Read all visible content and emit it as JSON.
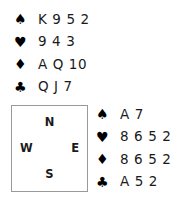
{
  "diagram": {
    "type": "bridge-hand-diagram",
    "suit_symbols": {
      "spade": "♠",
      "heart": "♥",
      "diamond": "♦",
      "club": "♣"
    },
    "suit_color": "#000000",
    "border_color": "#9a9a9a",
    "background_color": "#ffffff"
  },
  "north_hand": {
    "position": "North",
    "rows": [
      {
        "suit": "spade",
        "symbol": "♠",
        "cards": "K 9 5 2"
      },
      {
        "suit": "heart",
        "symbol": "♥",
        "cards": "9 4 3"
      },
      {
        "suit": "diamond",
        "symbol": "♦",
        "cards": "A Q 10"
      },
      {
        "suit": "club",
        "symbol": "♣",
        "cards": "Q J 7"
      }
    ]
  },
  "east_hand": {
    "position": "East",
    "rows": [
      {
        "suit": "spade",
        "symbol": "♠",
        "cards": "A 7"
      },
      {
        "suit": "heart",
        "symbol": "♥",
        "cards": "8 6 5 2"
      },
      {
        "suit": "diamond",
        "symbol": "♦",
        "cards": "8 6 5 2"
      },
      {
        "suit": "club",
        "symbol": "♣",
        "cards": "A 5 2"
      }
    ]
  },
  "compass": {
    "north": "N",
    "south": "S",
    "west": "W",
    "east": "E"
  }
}
